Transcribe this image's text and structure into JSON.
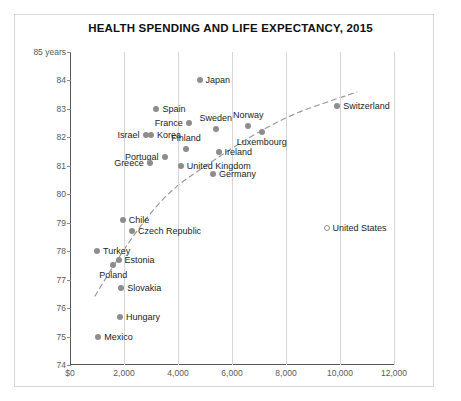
{
  "chart_data": {
    "type": "scatter",
    "title": "HEALTH SPENDING AND LIFE EXPECTANCY, 2015",
    "xlabel": "",
    "ylabel": "",
    "y_axis_note": "85 years",
    "xlim": [
      0,
      12000
    ],
    "ylim": [
      74,
      85
    ],
    "x_ticks": [
      "$0",
      "2,000",
      "4,000",
      "6,000",
      "8,000",
      "10,000",
      "12,000"
    ],
    "x_tick_values": [
      0,
      2000,
      4000,
      6000,
      8000,
      10000,
      12000
    ],
    "y_ticks": [
      "74",
      "75",
      "76",
      "77",
      "78",
      "79",
      "80",
      "81",
      "82",
      "83",
      "84",
      "85 years"
    ],
    "y_tick_values": [
      74,
      75,
      76,
      77,
      78,
      79,
      80,
      81,
      82,
      83,
      84,
      85
    ],
    "grid": "vertical",
    "legend": "none",
    "marker_color": "#8d8d8d",
    "trendline": {
      "style": "dashed",
      "color": "#9a9a9a",
      "description": "logarithmic fit rising from low spending to high spending"
    },
    "points": [
      {
        "name": "Japan",
        "x": 4800,
        "y": 84.0,
        "label_pos": "right",
        "marker": "filled"
      },
      {
        "name": "Spain",
        "x": 3200,
        "y": 83.0,
        "label_pos": "right",
        "marker": "filled"
      },
      {
        "name": "Switzerland",
        "x": 9900,
        "y": 83.1,
        "label_pos": "right",
        "marker": "filled"
      },
      {
        "name": "France",
        "x": 4400,
        "y": 82.5,
        "label_pos": "left",
        "marker": "filled"
      },
      {
        "name": "Sweden",
        "x": 5400,
        "y": 82.3,
        "label_pos": "above",
        "marker": "filled"
      },
      {
        "name": "Norway",
        "x": 6600,
        "y": 82.4,
        "label_pos": "above",
        "marker": "filled"
      },
      {
        "name": "Israel",
        "x": 2800,
        "y": 82.1,
        "label_pos": "left",
        "marker": "filled"
      },
      {
        "name": "Korea",
        "x": 3000,
        "y": 82.1,
        "label_pos": "right",
        "marker": "filled"
      },
      {
        "name": "Luxembourg",
        "x": 7100,
        "y": 82.2,
        "label_pos": "below",
        "marker": "filled"
      },
      {
        "name": "Finland",
        "x": 4300,
        "y": 81.6,
        "label_pos": "above",
        "marker": "filled"
      },
      {
        "name": "Ireland",
        "x": 5500,
        "y": 81.5,
        "label_pos": "right",
        "marker": "filled"
      },
      {
        "name": "Portugal",
        "x": 3500,
        "y": 81.3,
        "label_pos": "left",
        "marker": "filled"
      },
      {
        "name": "United Kingdom",
        "x": 4100,
        "y": 81.0,
        "label_pos": "right",
        "marker": "filled"
      },
      {
        "name": "Greece",
        "x": 2950,
        "y": 81.1,
        "label_pos": "left",
        "marker": "filled"
      },
      {
        "name": "Germany",
        "x": 5300,
        "y": 80.7,
        "label_pos": "right",
        "marker": "filled"
      },
      {
        "name": "Chile",
        "x": 1950,
        "y": 79.1,
        "label_pos": "right",
        "marker": "filled"
      },
      {
        "name": "Czech Republic",
        "x": 2300,
        "y": 78.7,
        "label_pos": "right",
        "marker": "filled"
      },
      {
        "name": "United States",
        "x": 9500,
        "y": 78.8,
        "label_pos": "right",
        "marker": "hollow"
      },
      {
        "name": "Turkey",
        "x": 1000,
        "y": 78.0,
        "label_pos": "right",
        "marker": "filled"
      },
      {
        "name": "Estonia",
        "x": 1800,
        "y": 77.7,
        "label_pos": "right",
        "marker": "filled"
      },
      {
        "name": "Poland",
        "x": 1600,
        "y": 77.5,
        "label_pos": "below",
        "marker": "filled"
      },
      {
        "name": "Slovakia",
        "x": 1900,
        "y": 76.7,
        "label_pos": "right",
        "marker": "filled"
      },
      {
        "name": "Hungary",
        "x": 1850,
        "y": 75.7,
        "label_pos": "right",
        "marker": "filled"
      },
      {
        "name": "Mexico",
        "x": 1050,
        "y": 75.0,
        "label_pos": "right",
        "marker": "filled"
      }
    ]
  }
}
